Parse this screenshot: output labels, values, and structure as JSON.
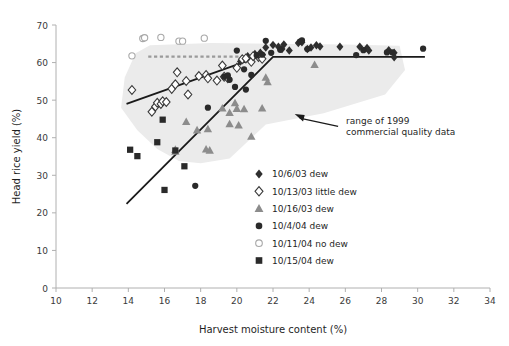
{
  "chart_data": {
    "type": "scatter",
    "title": "",
    "xlabel": "Harvest moisture content (%)",
    "ylabel": "Head rice yield (%)",
    "xlim": [
      10,
      34
    ],
    "ylim": [
      0,
      70
    ],
    "xticks": [
      10,
      12,
      14,
      16,
      18,
      20,
      22,
      24,
      26,
      28,
      30,
      32,
      34
    ],
    "yticks": [
      0,
      10,
      20,
      30,
      40,
      50,
      60,
      70
    ],
    "grid": false,
    "legend_position": "inside-lower-right",
    "series": [
      {
        "name": "10/6/03 dew",
        "marker": "filled-diamond",
        "color": "#2f2f2f",
        "points": [
          [
            21.6,
            64.0
          ],
          [
            22.0,
            64.7
          ],
          [
            22.3,
            64.2
          ],
          [
            22.5,
            63.6
          ],
          [
            22.6,
            64.8
          ],
          [
            22.9,
            63.2
          ],
          [
            23.4,
            65.2
          ],
          [
            23.6,
            65.4
          ],
          [
            23.9,
            63.6
          ],
          [
            24.1,
            64.0
          ],
          [
            24.4,
            64.6
          ],
          [
            24.6,
            64.3
          ],
          [
            25.7,
            64.2
          ],
          [
            26.8,
            64.2
          ],
          [
            27.2,
            63.9
          ],
          [
            27.3,
            63.2
          ],
          [
            28.4,
            63.3
          ],
          [
            28.7,
            62.6
          ],
          [
            28.7,
            61.4
          ],
          [
            20.6,
            61.7
          ],
          [
            21.0,
            62.3
          ],
          [
            21.3,
            62.6
          ],
          [
            20.2,
            60.3
          ]
        ]
      },
      {
        "name": "10/13/03 little dew",
        "marker": "open-diamond",
        "color": "#3a3a3a",
        "points": [
          [
            14.2,
            52.7
          ],
          [
            15.3,
            46.9
          ],
          [
            15.5,
            48.3
          ],
          [
            15.6,
            49.3
          ],
          [
            15.8,
            49.0
          ],
          [
            15.9,
            49.7
          ],
          [
            16.1,
            49.5
          ],
          [
            16.4,
            53.0
          ],
          [
            16.6,
            54.2
          ],
          [
            16.7,
            57.4
          ],
          [
            17.2,
            55.1
          ],
          [
            17.3,
            51.5
          ],
          [
            17.9,
            56.4
          ],
          [
            18.3,
            56.7
          ],
          [
            18.4,
            55.8
          ],
          [
            18.9,
            55.2
          ],
          [
            19.2,
            59.2
          ],
          [
            19.3,
            56.2
          ],
          [
            19.5,
            55.8
          ],
          [
            20.0,
            58.6
          ],
          [
            20.3,
            60.9
          ],
          [
            20.5,
            61.1
          ],
          [
            20.8,
            60.2
          ],
          [
            21.2,
            61.5
          ],
          [
            21.4,
            61.0
          ],
          [
            20.9,
            61.7
          ]
        ]
      },
      {
        "name": "10/16/03 dew",
        "marker": "filled-triangle",
        "color": "#8c8c8c",
        "points": [
          [
            16.6,
            36.3
          ],
          [
            17.2,
            44.2
          ],
          [
            17.8,
            42.0
          ],
          [
            18.3,
            36.9
          ],
          [
            18.4,
            42.3
          ],
          [
            18.5,
            36.6
          ],
          [
            19.2,
            47.8
          ],
          [
            19.6,
            46.6
          ],
          [
            19.9,
            49.2
          ],
          [
            20.0,
            47.7
          ],
          [
            20.1,
            43.3
          ],
          [
            20.4,
            47.6
          ],
          [
            20.8,
            40.3
          ],
          [
            21.4,
            47.8
          ],
          [
            21.6,
            56.0
          ],
          [
            21.7,
            54.8
          ],
          [
            24.3,
            59.4
          ],
          [
            16.6,
            36.8
          ],
          [
            19.6,
            43.6
          ]
        ]
      },
      {
        "name": "10/4/04 dew",
        "marker": "filled-circle",
        "color": "#2a2a2a",
        "points": [
          [
            17.7,
            27.2
          ],
          [
            18.4,
            48.0
          ],
          [
            19.3,
            56.2
          ],
          [
            19.5,
            56.6
          ],
          [
            19.6,
            55.4
          ],
          [
            19.9,
            53.5
          ],
          [
            20.0,
            63.2
          ],
          [
            20.4,
            58.2
          ],
          [
            20.5,
            52.8
          ],
          [
            20.8,
            56.7
          ],
          [
            21.1,
            61.9
          ],
          [
            21.4,
            62.1
          ],
          [
            21.6,
            65.8
          ],
          [
            21.9,
            62.6
          ],
          [
            22.4,
            63.4
          ],
          [
            23.5,
            65.6
          ],
          [
            23.6,
            65.9
          ],
          [
            23.9,
            63.6
          ],
          [
            26.6,
            62.0
          ],
          [
            27.0,
            63.3
          ],
          [
            28.3,
            62.7
          ],
          [
            28.6,
            62.7
          ],
          [
            30.3,
            63.7
          ]
        ]
      },
      {
        "name": "10/11/04 no dew",
        "marker": "open-circle",
        "color": "#a8a8a8",
        "points": [
          [
            14.2,
            61.8
          ],
          [
            14.8,
            66.4
          ],
          [
            14.9,
            66.6
          ],
          [
            15.8,
            66.7
          ],
          [
            16.8,
            65.7
          ],
          [
            17.0,
            65.7
          ],
          [
            18.2,
            66.5
          ]
        ]
      },
      {
        "name": "10/15/04 dew",
        "marker": "filled-square",
        "color": "#2a2a2a",
        "points": [
          [
            14.1,
            36.8
          ],
          [
            14.5,
            35.1
          ],
          [
            15.6,
            38.8
          ],
          [
            15.9,
            44.8
          ],
          [
            16.0,
            26.1
          ],
          [
            16.6,
            36.6
          ],
          [
            17.1,
            32.4
          ]
        ]
      }
    ],
    "trend_lines": [
      {
        "name": "little-dew-trend",
        "style": "solid",
        "color": "#1a1a1a",
        "points": [
          [
            13.9,
            49.0
          ],
          [
            21.6,
            62.2
          ]
        ]
      },
      {
        "name": "dew-trend",
        "style": "solid",
        "color": "#1a1a1a",
        "points": [
          [
            13.9,
            22.4
          ],
          [
            22.0,
            61.5
          ],
          [
            30.4,
            61.5
          ]
        ]
      },
      {
        "name": "no-dew-reference",
        "style": "dashed",
        "color": "#9a9a9a",
        "points": [
          [
            15.1,
            61.6
          ],
          [
            21.3,
            61.6
          ]
        ]
      }
    ],
    "annotations": [
      {
        "name": "range-of-1999-note",
        "lines": [
          "range of 1999",
          "commercial quality data"
        ],
        "arrow_from": [
          25.6,
          43.0
        ],
        "arrow_to": [
          23.2,
          46.3
        ]
      }
    ],
    "shaded_region": {
      "name": "range of 1999 commercial quality data",
      "color": "#ebebeb",
      "polygon": [
        [
          13.8,
          56.0
        ],
        [
          14.4,
          62.5
        ],
        [
          15.2,
          64.6
        ],
        [
          18.6,
          65.2
        ],
        [
          22.0,
          65.0
        ],
        [
          26.0,
          64.8
        ],
        [
          29.0,
          64.5
        ],
        [
          29.3,
          58.0
        ],
        [
          28.2,
          51.5
        ],
        [
          24.8,
          46.5
        ],
        [
          21.6,
          43.5
        ],
        [
          20.6,
          39.0
        ],
        [
          19.6,
          34.5
        ],
        [
          18.0,
          33.2
        ],
        [
          16.8,
          33.8
        ],
        [
          15.6,
          37.0
        ],
        [
          14.5,
          42.0
        ],
        [
          13.6,
          48.0
        ]
      ]
    }
  },
  "axes": {
    "x_title": "Harvest moisture content (%)",
    "y_title": "Head rice yield (%)",
    "x_tick_labels": [
      "10",
      "12",
      "14",
      "16",
      "18",
      "20",
      "22",
      "24",
      "26",
      "28",
      "30",
      "32",
      "34"
    ],
    "y_tick_labels": [
      "0",
      "10",
      "20",
      "30",
      "40",
      "50",
      "60",
      "70"
    ]
  },
  "legend": {
    "items": [
      {
        "label": "10/6/03 dew",
        "marker": "filled-diamond",
        "color": "#2f2f2f"
      },
      {
        "label": "10/13/03 little dew",
        "marker": "open-diamond",
        "color": "#3a3a3a"
      },
      {
        "label": "10/16/03 dew",
        "marker": "filled-triangle",
        "color": "#8c8c8c"
      },
      {
        "label": "10/4/04 dew",
        "marker": "filled-circle",
        "color": "#2a2a2a"
      },
      {
        "label": "10/11/04 no dew",
        "marker": "open-circle",
        "color": "#a8a8a8"
      },
      {
        "label": "10/15/04 dew",
        "marker": "filled-square",
        "color": "#2a2a2a"
      }
    ]
  },
  "annotation_text": {
    "line1": "range of 1999",
    "line2": "commercial quality data"
  }
}
